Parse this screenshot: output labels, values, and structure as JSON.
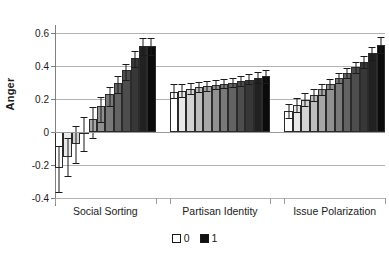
{
  "chart_data": {
    "type": "bar",
    "title": "",
    "xlabel": "",
    "ylabel": "Anger",
    "ylim": [
      -0.4,
      0.6
    ],
    "yticks": [
      -0.4,
      -0.2,
      0,
      0.2,
      0.4,
      0.6
    ],
    "ytick_labels": [
      "-0.4",
      "-0.2",
      "0",
      "0.2",
      "0.4",
      "0.6"
    ],
    "grid": true,
    "legend_position": "bottom",
    "legend": [
      {
        "label": "0",
        "color": "#ffffff"
      },
      {
        "label": "1",
        "color": "#111111"
      }
    ],
    "colorbar_note": "bars shade continuously from white (value 0) to black (value 1)",
    "categories": [
      "Social Sorting",
      "Partisan Identity",
      "Issue Polarization"
    ],
    "groups": [
      {
        "name": "Social Sorting",
        "x": [
          0.0,
          0.09,
          0.18,
          0.27,
          0.36,
          0.45,
          0.55,
          0.64,
          0.73,
          0.82,
          0.91,
          1.0
        ],
        "values": [
          -0.22,
          -0.15,
          -0.07,
          -0.01,
          0.08,
          0.155,
          0.23,
          0.3,
          0.375,
          0.45,
          0.52,
          0.52
        ],
        "err_low": [
          -0.365,
          -0.265,
          -0.185,
          -0.115,
          -0.035,
          0.06,
          0.155,
          0.235,
          0.315,
          0.395,
          0.465,
          0.465
        ],
        "err_high": [
          -0.085,
          -0.035,
          0.035,
          0.09,
          0.15,
          0.215,
          0.275,
          0.34,
          0.415,
          0.49,
          0.57,
          0.57
        ]
      },
      {
        "name": "Partisan Identity",
        "x": [
          0.0,
          0.09,
          0.18,
          0.27,
          0.36,
          0.45,
          0.55,
          0.64,
          0.73,
          0.82,
          0.91,
          1.0
        ],
        "values": [
          0.245,
          0.25,
          0.26,
          0.27,
          0.278,
          0.285,
          0.292,
          0.3,
          0.31,
          0.318,
          0.328,
          0.34
        ],
        "err_low": [
          0.205,
          0.215,
          0.228,
          0.24,
          0.25,
          0.258,
          0.265,
          0.272,
          0.28,
          0.288,
          0.295,
          0.3
        ],
        "err_high": [
          0.288,
          0.292,
          0.298,
          0.305,
          0.31,
          0.315,
          0.322,
          0.33,
          0.34,
          0.35,
          0.362,
          0.378
        ]
      },
      {
        "name": "Issue Polarization",
        "x": [
          0.0,
          0.09,
          0.18,
          0.27,
          0.36,
          0.45,
          0.55,
          0.64,
          0.73,
          0.82,
          0.91,
          1.0
        ],
        "values": [
          0.13,
          0.165,
          0.195,
          0.225,
          0.258,
          0.29,
          0.325,
          0.358,
          0.392,
          0.425,
          0.478,
          0.528
        ],
        "err_low": [
          0.082,
          0.12,
          0.155,
          0.19,
          0.225,
          0.258,
          0.295,
          0.325,
          0.358,
          0.388,
          0.435,
          0.478
        ],
        "err_high": [
          0.172,
          0.205,
          0.235,
          0.262,
          0.292,
          0.322,
          0.355,
          0.39,
          0.425,
          0.462,
          0.518,
          0.578
        ]
      }
    ]
  },
  "axis": {
    "y_title": "Anger"
  },
  "legend": {
    "items": [
      {
        "name": "legend-zero",
        "label": "0"
      },
      {
        "name": "legend-one",
        "label": "1"
      }
    ]
  }
}
